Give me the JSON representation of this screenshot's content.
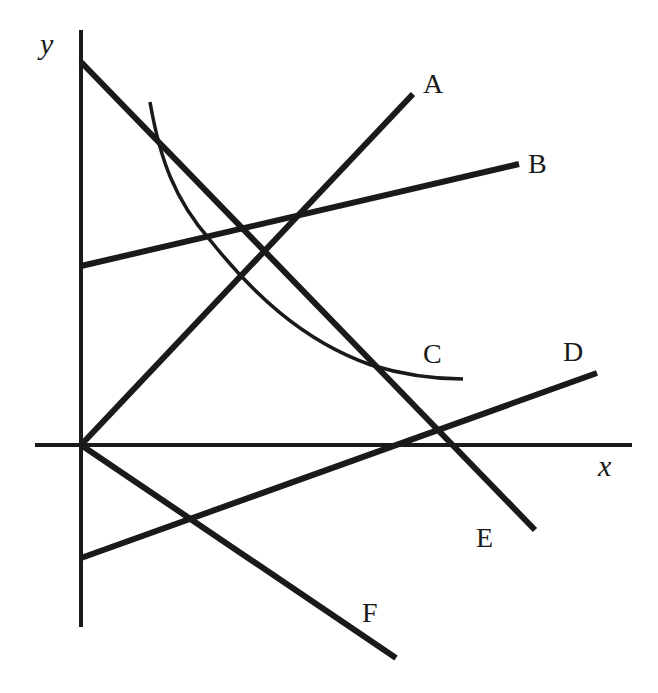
{
  "diagram": {
    "axes": {
      "x_label": "x",
      "y_label": "y",
      "origin": [
        81,
        445
      ],
      "x_axis": {
        "x1": 35,
        "y1": 445,
        "x2": 632,
        "y2": 445
      },
      "y_axis": {
        "x1": 81,
        "y1": 30,
        "x2": 81,
        "y2": 627
      }
    },
    "lines": [
      {
        "id": "A",
        "label": "A",
        "type": "line",
        "x1": 81,
        "y1": 445,
        "x2": 413,
        "y2": 94,
        "label_pos": [
          423,
          93
        ]
      },
      {
        "id": "B",
        "label": "B",
        "type": "line",
        "x1": 81,
        "y1": 266,
        "x2": 519,
        "y2": 164,
        "label_pos": [
          528,
          173
        ]
      },
      {
        "id": "C",
        "label": "C",
        "type": "curve",
        "path": "M150,102 C160,160 175,200 210,240 C250,290 300,340 371,365 C410,377 440,379 463,379",
        "label_pos": [
          423,
          363
        ]
      },
      {
        "id": "D",
        "label": "D",
        "type": "line",
        "x1": 81,
        "y1": 558,
        "x2": 597,
        "y2": 373,
        "label_pos": [
          563,
          361
        ]
      },
      {
        "id": "E",
        "label": "E",
        "type": "line",
        "x1": 81,
        "y1": 62,
        "x2": 535,
        "y2": 530,
        "label_pos": [
          476,
          547
        ]
      },
      {
        "id": "F",
        "label": "F",
        "type": "line",
        "x1": 81,
        "y1": 445,
        "x2": 396,
        "y2": 658,
        "label_pos": [
          362,
          622
        ]
      }
    ],
    "axis_label_positions": {
      "x": [
        598,
        476
      ],
      "y": [
        40,
        54
      ]
    },
    "colors": {
      "stroke": "#1a1a1a",
      "background": "#ffffff"
    }
  }
}
